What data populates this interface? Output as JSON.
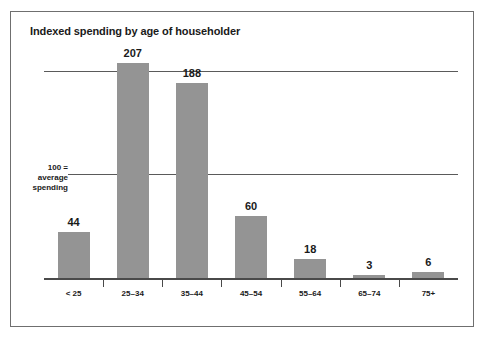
{
  "chart_data": {
    "type": "bar",
    "title": "Indexed spending by age of householder",
    "xlabel": "",
    "ylabel": "",
    "categories": [
      "< 25",
      "25–34",
      "35–44",
      "45–54",
      "55–64",
      "65–74",
      "75+"
    ],
    "values": [
      44,
      207,
      188,
      60,
      18,
      3,
      6
    ],
    "value_labels": [
      "44",
      "207",
      "188",
      "60",
      "18",
      "3",
      "6"
    ],
    "ylim": [
      0,
      215
    ],
    "gridlines": [
      100,
      200
    ],
    "grid": true,
    "legend": null,
    "annotations": [
      {
        "name": "baseline-note",
        "lines": [
          "100 =",
          "average",
          "spending"
        ],
        "at_value": 100
      }
    ],
    "colors": {
      "bar_fill": "#949494",
      "gridline": "#5a5a5a",
      "axis": "#4a4a4a",
      "text": "#1a1a1a",
      "frame": "#6f6f6f",
      "background": "#ffffff"
    }
  }
}
